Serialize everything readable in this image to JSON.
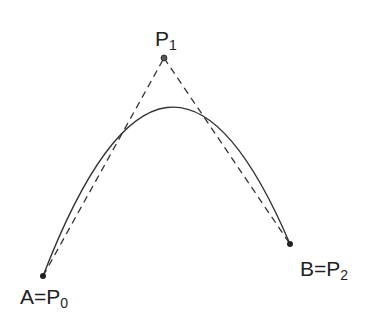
{
  "diagram": {
    "points": {
      "p0": {
        "label_main": "A=P",
        "label_sub": "0",
        "x": 43,
        "y": 276
      },
      "p1": {
        "label_main": "P",
        "label_sub": "1",
        "x": 164,
        "y": 58
      },
      "p2": {
        "label_main": "B=P",
        "label_sub": "2",
        "x": 290,
        "y": 244
      }
    },
    "curve": {
      "type": "quadratic-bezier",
      "style": "solid",
      "color": "#333333"
    },
    "control_polygon": {
      "style": "dashed",
      "color": "#333333"
    },
    "point_color": "#333333"
  }
}
